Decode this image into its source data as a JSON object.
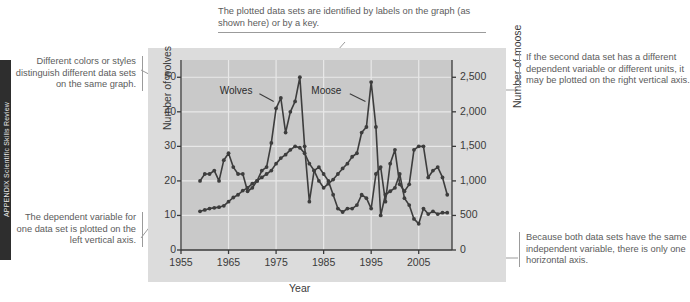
{
  "edge_strip": {
    "running_head": "APPENDIX  Scientific Skills Review"
  },
  "chart_data": {
    "type": "line",
    "title": "",
    "xlabel": "Year",
    "ylabel": "Number of wolves",
    "ylabel_right": "Number of moose",
    "xlim": [
      1955,
      2012
    ],
    "xticks": [
      "1955",
      "1965",
      "1975",
      "1985",
      "1995",
      "2005"
    ],
    "xtick_values": [
      1955,
      1965,
      1975,
      1985,
      1995,
      2005
    ],
    "ylim": [
      0,
      55
    ],
    "yticks": [
      "0",
      "10",
      "20",
      "30",
      "40",
      "50"
    ],
    "ytick_values": [
      0,
      10,
      20,
      30,
      40,
      50
    ],
    "ylim_right": [
      0,
      2750
    ],
    "yticks_right": [
      "0",
      "500",
      "1,000",
      "1,500",
      "2,000",
      "2,500"
    ],
    "ytick_values_right": [
      0,
      500,
      1000,
      1500,
      2000,
      2500
    ],
    "grid": true,
    "legend_position": "inline-labels",
    "series": [
      {
        "name": "Wolves",
        "axis": "left",
        "label_text": "Wolves",
        "x": [
          1959,
          1960,
          1961,
          1962,
          1963,
          1964,
          1965,
          1966,
          1967,
          1968,
          1969,
          1970,
          1971,
          1972,
          1973,
          1974,
          1975,
          1976,
          1977,
          1978,
          1979,
          1980,
          1981,
          1982,
          1983,
          1984,
          1985,
          1986,
          1987,
          1988,
          1989,
          1990,
          1991,
          1992,
          1993,
          1994,
          1995,
          1996,
          1997,
          1998,
          1999,
          2000,
          2001,
          2002,
          2003,
          2004,
          2005,
          2006,
          2007,
          2008,
          2009,
          2010,
          2011
        ],
        "values": [
          20,
          22,
          22,
          23,
          20,
          26,
          28,
          24,
          22,
          22,
          17,
          18,
          20,
          23,
          24,
          31,
          41,
          44,
          34,
          40,
          43,
          50,
          30,
          14,
          23,
          24,
          22,
          20,
          16,
          12,
          11,
          12,
          12,
          13,
          16,
          15,
          12,
          22,
          24,
          14,
          25,
          29,
          19,
          17,
          19,
          29,
          30,
          30,
          21,
          23,
          24,
          21,
          16
        ]
      },
      {
        "name": "Moose",
        "axis": "right",
        "label_text": "Moose",
        "x": [
          1959,
          1960,
          1961,
          1962,
          1963,
          1964,
          1965,
          1966,
          1967,
          1968,
          1969,
          1970,
          1971,
          1972,
          1973,
          1974,
          1975,
          1976,
          1977,
          1978,
          1979,
          1980,
          1981,
          1982,
          1983,
          1984,
          1985,
          1986,
          1987,
          1988,
          1989,
          1990,
          1991,
          1992,
          1993,
          1994,
          1995,
          1996,
          1997,
          1998,
          1999,
          2000,
          2001,
          2002,
          2003,
          2004,
          2005,
          2006,
          2007,
          2008,
          2009,
          2010,
          2011
        ],
        "values": [
          560,
          580,
          600,
          610,
          620,
          640,
          700,
          760,
          800,
          860,
          900,
          960,
          1000,
          1050,
          1100,
          1150,
          1250,
          1330,
          1380,
          1450,
          1500,
          1480,
          1400,
          1250,
          1150,
          1000,
          900,
          960,
          1020,
          1100,
          1180,
          1250,
          1350,
          1400,
          1700,
          1780,
          2430,
          1780,
          500,
          800,
          850,
          900,
          1100,
          750,
          650,
          450,
          380,
          600,
          520,
          560,
          520,
          540,
          540
        ]
      }
    ]
  },
  "annotations": {
    "top": "The plotted data sets are identified by labels on the graph (as shown here) or by a key.",
    "left_upper": "Different colors or styles distinguish different data sets on the same graph.",
    "left_lower": "The dependent variable for one data set is plotted on the left vertical axis.",
    "right_upper": "If the second data set has a different dependent variable or different units, it may be plotted on the right vertical axis.",
    "right_lower": "Because both data sets have the same independent variable, there is only one horizontal axis."
  }
}
